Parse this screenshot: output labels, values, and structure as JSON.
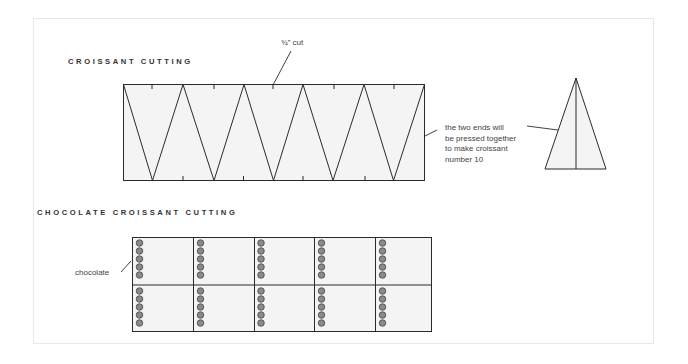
{
  "croissant_section": {
    "heading": "CROISSANT CUTTING",
    "cut_label": "¾” cut",
    "note_lines": [
      "the two ends will",
      "be pressed together",
      "to make croissant",
      "number 10"
    ]
  },
  "chocolate_section": {
    "heading": "CHOCOLATE CROISSANT CUTTING",
    "chocolate_label": "chocolate",
    "grid": {
      "rows": 2,
      "cols": 5,
      "dots_per_cell": 5
    }
  },
  "colors": {
    "line": "#2b2b2b",
    "dough_fill": "#f4f4f4",
    "chocolate_fill": "#8a8a8a",
    "frame_border": "#e8e8e8"
  }
}
